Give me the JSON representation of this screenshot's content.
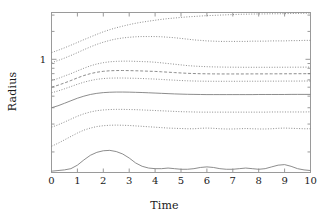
{
  "chart_data": {
    "type": "line",
    "title": "",
    "xlabel": "Time",
    "ylabel": "Radius",
    "xlim": [
      0,
      10
    ],
    "ylim_log": [
      0.06,
      3.2
    ],
    "yscale": "log",
    "xscale": "linear",
    "grid": false,
    "legend": "none",
    "xticks": [
      0,
      1,
      2,
      3,
      4,
      5,
      6,
      7,
      8,
      9,
      10
    ],
    "xtick_labels": [
      "0",
      "1",
      "2",
      "3",
      "4",
      "5",
      "6",
      "7",
      "8",
      "9",
      "10"
    ],
    "yticks": [
      1
    ],
    "ytick_labels": [
      "1"
    ],
    "line_color": "#808080",
    "frame_color": "#9a9a9a",
    "x": [
      0,
      0.25,
      0.5,
      0.75,
      1,
      1.25,
      1.5,
      1.75,
      2,
      2.25,
      2.5,
      2.75,
      3,
      3.25,
      3.5,
      3.75,
      4,
      4.25,
      4.5,
      4.75,
      5,
      5.25,
      5.5,
      5.75,
      6,
      6.25,
      6.5,
      6.75,
      7,
      7.25,
      7.5,
      7.75,
      8,
      8.25,
      8.5,
      8.75,
      9,
      9.25,
      9.5,
      9.75,
      10
    ],
    "series": [
      {
        "name": "contour-9",
        "style": "dotted",
        "values": [
          1.18,
          1.25,
          1.33,
          1.42,
          1.52,
          1.63,
          1.74,
          1.86,
          1.98,
          2.09,
          2.19,
          2.28,
          2.37,
          2.45,
          2.52,
          2.58,
          2.64,
          2.7,
          2.75,
          2.79,
          2.83,
          2.87,
          2.9,
          2.93,
          2.96,
          2.98,
          3.0,
          3.02,
          3.04,
          3.06,
          3.07,
          3.08,
          3.09,
          3.09,
          3.1,
          3.1,
          3.11,
          3.12,
          3.13,
          3.14,
          3.15
        ]
      },
      {
        "name": "contour-8",
        "style": "dotted",
        "values": [
          0.92,
          0.97,
          1.03,
          1.1,
          1.18,
          1.27,
          1.36,
          1.45,
          1.53,
          1.6,
          1.66,
          1.7,
          1.73,
          1.75,
          1.76,
          1.76,
          1.76,
          1.75,
          1.73,
          1.71,
          1.68,
          1.65,
          1.62,
          1.6,
          1.58,
          1.57,
          1.56,
          1.56,
          1.56,
          1.56,
          1.56,
          1.57,
          1.57,
          1.57,
          1.58,
          1.58,
          1.58,
          1.59,
          1.59,
          1.6,
          1.6
        ]
      },
      {
        "name": "contour-7",
        "style": "dotted",
        "values": [
          0.59,
          0.62,
          0.66,
          0.7,
          0.75,
          0.8,
          0.85,
          0.89,
          0.92,
          0.94,
          0.95,
          0.955,
          0.955,
          0.95,
          0.945,
          0.94,
          0.93,
          0.915,
          0.9,
          0.885,
          0.87,
          0.855,
          0.845,
          0.838,
          0.832,
          0.828,
          0.825,
          0.823,
          0.822,
          0.821,
          0.82,
          0.82,
          0.82,
          0.82,
          0.82,
          0.821,
          0.821,
          0.822,
          0.822,
          0.823,
          0.824
        ]
      },
      {
        "name": "contour-6",
        "style": "dashed",
        "values": [
          0.5,
          0.525,
          0.555,
          0.59,
          0.63,
          0.668,
          0.7,
          0.725,
          0.742,
          0.752,
          0.756,
          0.757,
          0.755,
          0.752,
          0.748,
          0.744,
          0.74,
          0.733,
          0.726,
          0.719,
          0.712,
          0.706,
          0.702,
          0.699,
          0.697,
          0.696,
          0.695,
          0.695,
          0.695,
          0.695,
          0.695,
          0.696,
          0.696,
          0.696,
          0.697,
          0.697,
          0.698,
          0.698,
          0.699,
          0.699,
          0.7
        ]
      },
      {
        "name": "contour-5",
        "style": "dotted",
        "values": [
          0.435,
          0.455,
          0.48,
          0.508,
          0.538,
          0.566,
          0.59,
          0.608,
          0.62,
          0.626,
          0.628,
          0.628,
          0.626,
          0.623,
          0.62,
          0.616,
          0.612,
          0.606,
          0.6,
          0.595,
          0.59,
          0.586,
          0.583,
          0.581,
          0.58,
          0.579,
          0.579,
          0.579,
          0.579,
          0.579,
          0.58,
          0.58,
          0.58,
          0.581,
          0.581,
          0.581,
          0.582,
          0.582,
          0.582,
          0.583,
          0.583
        ]
      },
      {
        "name": "contour-4",
        "style": "solid",
        "values": [
          0.3,
          0.315,
          0.335,
          0.357,
          0.38,
          0.4,
          0.417,
          0.429,
          0.437,
          0.441,
          0.443,
          0.443,
          0.442,
          0.44,
          0.438,
          0.435,
          0.432,
          0.429,
          0.426,
          0.423,
          0.421,
          0.419,
          0.418,
          0.417,
          0.416,
          0.416,
          0.416,
          0.416,
          0.416,
          0.416,
          0.416,
          0.416,
          0.417,
          0.417,
          0.417,
          0.417,
          0.417,
          0.418,
          0.418,
          0.418,
          0.418
        ]
      },
      {
        "name": "contour-3",
        "style": "dotted",
        "values": [
          0.185,
          0.196,
          0.21,
          0.226,
          0.243,
          0.258,
          0.27,
          0.279,
          0.284,
          0.287,
          0.288,
          0.288,
          0.287,
          0.286,
          0.284,
          0.282,
          0.28,
          0.278,
          0.276,
          0.274,
          0.272,
          0.271,
          0.27,
          0.269,
          0.269,
          0.269,
          0.269,
          0.269,
          0.269,
          0.269,
          0.269,
          0.269,
          0.269,
          0.269,
          0.27,
          0.27,
          0.27,
          0.27,
          0.27,
          0.27,
          0.271
        ]
      },
      {
        "name": "contour-2",
        "style": "dotted",
        "values": [
          0.115,
          0.124,
          0.135,
          0.147,
          0.16,
          0.172,
          0.181,
          0.188,
          0.192,
          0.194,
          0.195,
          0.194,
          0.193,
          0.191,
          0.189,
          0.187,
          0.185,
          0.183,
          0.181,
          0.18,
          0.179,
          0.178,
          0.178,
          0.18,
          0.181,
          0.18,
          0.178,
          0.177,
          0.177,
          0.178,
          0.179,
          0.178,
          0.177,
          0.177,
          0.178,
          0.18,
          0.181,
          0.18,
          0.179,
          0.178,
          0.178
        ]
      },
      {
        "name": "contour-1",
        "style": "solid",
        "values": [
          0.062,
          0.063,
          0.064,
          0.066,
          0.072,
          0.082,
          0.092,
          0.099,
          0.103,
          0.104,
          0.101,
          0.095,
          0.086,
          0.076,
          0.07,
          0.067,
          0.066,
          0.066,
          0.067,
          0.066,
          0.065,
          0.065,
          0.066,
          0.068,
          0.069,
          0.068,
          0.066,
          0.065,
          0.065,
          0.066,
          0.067,
          0.066,
          0.065,
          0.066,
          0.069,
          0.072,
          0.073,
          0.07,
          0.066,
          0.064,
          0.063
        ]
      }
    ]
  }
}
